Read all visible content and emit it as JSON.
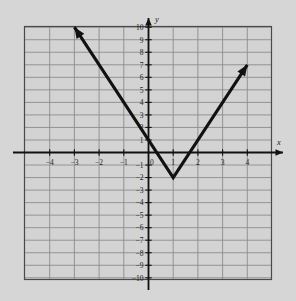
{
  "figure": {
    "title": "",
    "background_color": "#d6d6d6",
    "plot_background_color": "#d4d4d4",
    "grid_line_color": "#8a8a8a",
    "border_color": "#4a4a4a",
    "axis_color": "#111111",
    "curve_color": "#111111",
    "x_axis_name": "x",
    "y_axis_name": "y"
  },
  "chart_data": {
    "type": "line",
    "title": "",
    "xlabel": "x",
    "ylabel": "y",
    "xlim": [
      -5,
      5
    ],
    "ylim": [
      -10,
      10
    ],
    "grid": true,
    "legend": "none",
    "x_ticks": [
      -4,
      -3,
      -2,
      -1,
      0,
      1,
      2,
      3,
      4
    ],
    "x_tick_labels": [
      "−4",
      "−3",
      "−2",
      "−1",
      "0",
      "1",
      "2",
      "3",
      "4"
    ],
    "y_ticks": [
      10,
      9,
      8,
      7,
      6,
      5,
      4,
      3,
      2,
      1,
      -1,
      -2,
      -3,
      -4,
      -5,
      -6,
      -7,
      -8,
      -9,
      -10
    ],
    "y_tick_labels": [
      "10",
      "9",
      "8",
      "7",
      "6",
      "5",
      "4",
      "3",
      "2",
      "1",
      "−1",
      "−2",
      "−3",
      "−4",
      "−5",
      "−6",
      "−7",
      "−8",
      "−9",
      "−10"
    ],
    "series": [
      {
        "name": "v-shaped-graph",
        "type": "piecewise-linear",
        "arrow_start": true,
        "arrow_end": true,
        "points": [
          {
            "x": -3,
            "y": 10
          },
          {
            "x": 1,
            "y": -2
          },
          {
            "x": 4,
            "y": 7
          }
        ]
      }
    ],
    "annotations": [
      {
        "name": "vertex",
        "x": 1,
        "y": -2
      },
      {
        "name": "y-intercept",
        "x": 0,
        "y": 1
      }
    ]
  }
}
